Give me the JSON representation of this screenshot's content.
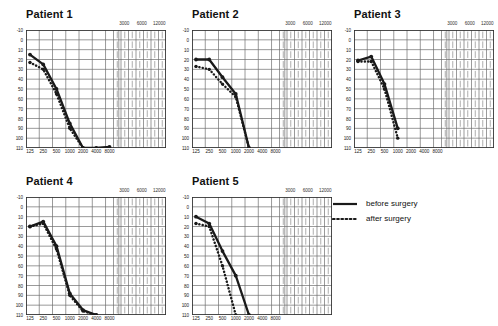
{
  "figure": {
    "panels": [
      {
        "title": "Patient 1",
        "x": 2,
        "y": 8,
        "w": 170,
        "h": 160,
        "plot_w": 140,
        "plot_h": 118
      },
      {
        "title": "Patient 2",
        "x": 168,
        "y": 8,
        "w": 170,
        "h": 160,
        "plot_w": 140,
        "plot_h": 118
      },
      {
        "title": "Patient 3",
        "x": 330,
        "y": 8,
        "w": 170,
        "h": 160,
        "plot_w": 140,
        "plot_h": 118
      },
      {
        "title": "Patient 4",
        "x": 2,
        "y": 175,
        "w": 170,
        "h": 160,
        "plot_w": 140,
        "plot_h": 118
      },
      {
        "title": "Patient 5",
        "x": 168,
        "y": 175,
        "w": 170,
        "h": 160,
        "plot_w": 140,
        "plot_h": 118
      }
    ],
    "legend": {
      "position": "right-middle",
      "items": [
        {
          "label": "before surgery",
          "style": "solid",
          "color": "#1a1a1a"
        },
        {
          "label": "after surgery",
          "style": "dotted",
          "color": "#1a1a1a"
        }
      ]
    }
  },
  "chart_data": {
    "type": "line",
    "title": "",
    "xlabel": "",
    "ylabel": "",
    "grid": true,
    "legend_position": "right",
    "xscale": "log-octave",
    "xlabel_ticks": [
      "125",
      "250",
      "500",
      "1000",
      "2000",
      "4000",
      "8000"
    ],
    "xtick_values": [
      125,
      250,
      500,
      1000,
      2000,
      4000,
      8000
    ],
    "top_axis_ticks": [
      "3000",
      "6000",
      "12000"
    ],
    "top_axis_values": [
      3000,
      6000,
      12000
    ],
    "ylabel_ticks": [
      "-10",
      "0",
      "10",
      "20",
      "30",
      "40",
      "50",
      "60",
      "70",
      "80",
      "90",
      "100",
      "110"
    ],
    "ytick_values": [
      -10,
      0,
      10,
      20,
      30,
      40,
      50,
      60,
      70,
      80,
      90,
      100,
      110
    ],
    "ylim": [
      -10,
      110
    ],
    "y_inverted": true,
    "series_names": [
      "before surgery",
      "after surgery"
    ],
    "panels": [
      {
        "name": "Patient 1",
        "series": [
          {
            "name": "before surgery",
            "x": [
              125,
              250,
              500,
              1000,
              2000,
              4000,
              8000
            ],
            "values": [
              15,
              25,
              50,
              85,
              110,
              110,
              109
            ]
          },
          {
            "name": "after surgery",
            "x": [
              125,
              250,
              500,
              1000,
              2000
            ],
            "values": [
              23,
              30,
              55,
              90,
              110
            ]
          }
        ]
      },
      {
        "name": "Patient 2",
        "series": [
          {
            "name": "before surgery",
            "x": [
              125,
              250,
              500,
              1000,
              2000
            ],
            "values": [
              20,
              20,
              38,
              55,
              110
            ]
          },
          {
            "name": "after surgery",
            "x": [
              125,
              250,
              500,
              1000,
              2000
            ],
            "values": [
              27,
              30,
              45,
              58,
              110
            ]
          }
        ]
      },
      {
        "name": "Patient 3",
        "series": [
          {
            "name": "before surgery",
            "x": [
              125,
              250,
              500,
              1000
            ],
            "values": [
              21,
              17,
              45,
              90
            ]
          },
          {
            "name": "after surgery",
            "x": [
              125,
              250,
              500,
              1000
            ],
            "values": [
              22,
              22,
              50,
              100
            ]
          }
        ]
      },
      {
        "name": "Patient 4",
        "series": [
          {
            "name": "before surgery",
            "x": [
              125,
              250,
              500,
              1000,
              2000,
              4000
            ],
            "values": [
              20,
              15,
              40,
              88,
              105,
              110
            ]
          },
          {
            "name": "after surgery",
            "x": [
              125,
              250,
              500,
              1000,
              2000,
              4000
            ],
            "values": [
              20,
              17,
              43,
              90,
              106,
              110
            ]
          }
        ]
      },
      {
        "name": "Patient 5",
        "series": [
          {
            "name": "before surgery",
            "x": [
              125,
              250,
              500,
              1000,
              2000
            ],
            "values": [
              10,
              17,
              45,
              70,
              110
            ]
          },
          {
            "name": "after surgery",
            "x": [
              125,
              250,
              500,
              1000
            ],
            "values": [
              17,
              20,
              60,
              110
            ]
          }
        ]
      }
    ]
  }
}
